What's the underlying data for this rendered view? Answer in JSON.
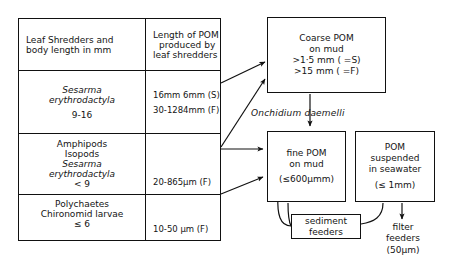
{
  "diagram": {
    "type": "flow-diagram"
  },
  "table": {
    "header": {
      "left": [
        "Leaf Shredders and",
        "body length in mm"
      ],
      "right": [
        "Length of POM",
        "produced by",
        "leaf shredders"
      ]
    },
    "rows": [
      {
        "organisms": [
          "Sesarma",
          "erythrodactyla",
          "9-16"
        ],
        "organisms_italic": [
          true,
          true,
          false
        ],
        "pom": [
          "16mm  6mm (S)",
          "30-1284mm (F)"
        ]
      },
      {
        "organisms": [
          "Amphipods",
          "Isopods",
          "Sesarma",
          "erythrodactyla",
          "< 9"
        ],
        "organisms_italic": [
          false,
          false,
          true,
          true,
          false
        ],
        "pom": [
          "20-865µm (F)"
        ]
      },
      {
        "organisms": [
          "Polychaetes",
          "Chironomid larvae",
          "≤ 6"
        ],
        "organisms_italic": [
          false,
          false,
          false
        ],
        "pom": [
          "10-50 µm (F)"
        ]
      }
    ]
  },
  "boxes": {
    "coarse_pom": {
      "lines": [
        "Coarse POM",
        "on mud",
        ">1·5 mm ( =S)",
        ">15 mm ( =F)"
      ]
    },
    "fine_pom": {
      "lines": [
        "fine POM",
        "on mud",
        "",
        "(≤600µmm)"
      ]
    },
    "suspended_pom": {
      "lines": [
        "POM",
        "suspended",
        "in seawater",
        "",
        "(≤ 1mm)"
      ]
    },
    "sediment_feeders": {
      "lines": [
        "sediment",
        "feeders"
      ]
    }
  },
  "labels": {
    "onchidium": "Onchidium daemelli",
    "filter_feeders": [
      "filter",
      "feeders",
      "(50µm)"
    ]
  },
  "colors": {
    "stroke": "#111111",
    "background": "#ffffff",
    "text": "#141414"
  }
}
